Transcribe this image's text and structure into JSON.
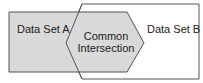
{
  "diagram": {
    "type": "venn-style overlap",
    "colors": {
      "set_a_fill": "#d9d9d9",
      "intersection_fill": "#d9d9d9",
      "set_b_fill": "#ffffff",
      "stroke": "#555555",
      "text": "#222222"
    },
    "set_a": {
      "label": "Data Set A"
    },
    "set_b": {
      "label": "Data Set B"
    },
    "intersection": {
      "line1": "Common",
      "line2": "Intersection"
    }
  }
}
